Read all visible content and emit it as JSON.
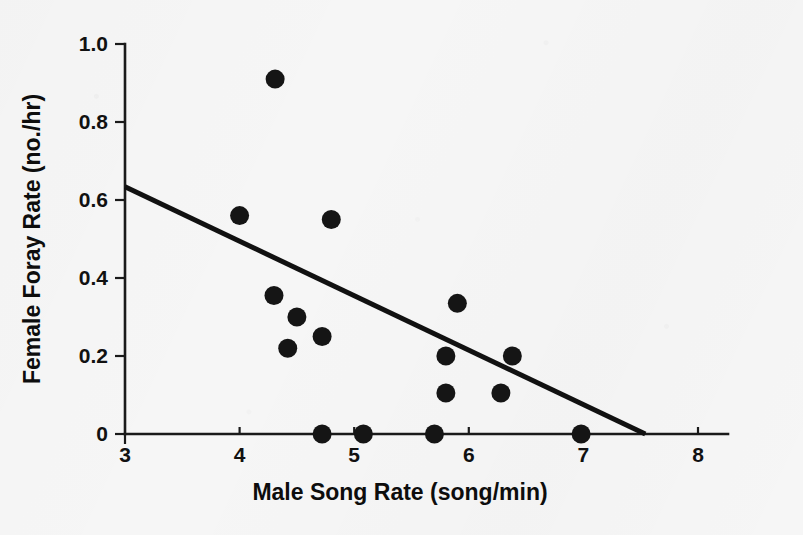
{
  "chart_data": {
    "type": "scatter",
    "title": "",
    "xlabel": "Male Song Rate (song/min)",
    "ylabel": "Female Foray Rate (no./hr)",
    "xlim": [
      3,
      8
    ],
    "ylim": [
      0,
      1.0
    ],
    "xticks": [
      3,
      4,
      5,
      6,
      7,
      8
    ],
    "xtick_labels": [
      "3",
      "4",
      "5",
      "6",
      "7",
      "8"
    ],
    "yticks": [
      0,
      0.2,
      0.4,
      0.6,
      0.8,
      1.0
    ],
    "ytick_labels": [
      "0",
      "0.2",
      "0.4",
      "0.6",
      "0.8",
      "1.0"
    ],
    "grid": false,
    "legend": null,
    "marker": {
      "shape": "circle",
      "color": "#151515",
      "size_px": 19
    },
    "points": [
      {
        "x": 4.31,
        "y": 0.91
      },
      {
        "x": 4.0,
        "y": 0.56
      },
      {
        "x": 4.8,
        "y": 0.55
      },
      {
        "x": 4.3,
        "y": 0.355
      },
      {
        "x": 4.5,
        "y": 0.3
      },
      {
        "x": 4.72,
        "y": 0.25
      },
      {
        "x": 4.42,
        "y": 0.22
      },
      {
        "x": 5.9,
        "y": 0.335
      },
      {
        "x": 5.8,
        "y": 0.2
      },
      {
        "x": 6.38,
        "y": 0.2
      },
      {
        "x": 5.8,
        "y": 0.105
      },
      {
        "x": 6.28,
        "y": 0.105
      },
      {
        "x": 4.72,
        "y": 0.0
      },
      {
        "x": 5.08,
        "y": 0.0
      },
      {
        "x": 5.7,
        "y": 0.0
      },
      {
        "x": 6.98,
        "y": 0.0
      }
    ],
    "trendline": {
      "type": "linear",
      "x_start": 3.0,
      "y_start": 0.634,
      "x_end": 7.54,
      "y_end": 0.0,
      "slope": -0.1396,
      "intercept": 1.053
    }
  },
  "axis_titles": {
    "x": "Male Song Rate (song/min)",
    "y": "Female Foray Rate (no./hr)"
  }
}
